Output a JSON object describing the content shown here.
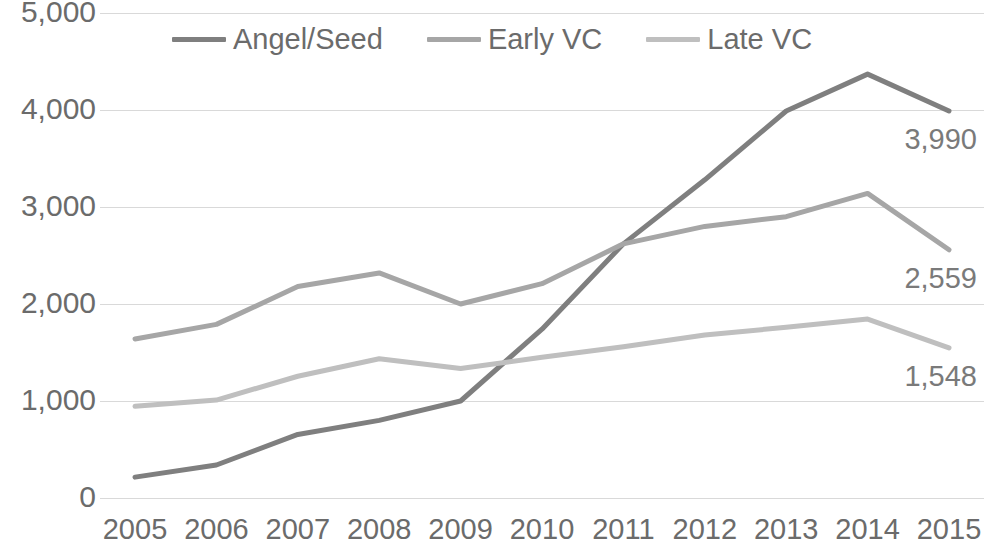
{
  "chart_data": {
    "type": "line",
    "title": "",
    "subtitle": "",
    "xlabel": "",
    "ylabel": "",
    "x": [
      2005,
      2006,
      2007,
      2008,
      2009,
      2010,
      2011,
      2012,
      2013,
      2014,
      2015
    ],
    "categories": [
      "2005",
      "2006",
      "2007",
      "2008",
      "2009",
      "2010",
      "2011",
      "2012",
      "2013",
      "2014",
      "2015"
    ],
    "series": [
      {
        "name": "Angel/Seed",
        "color": "#7f7f7f",
        "values": [
          215,
          340,
          655,
          800,
          1000,
          1740,
          2620,
          3280,
          3990,
          4370,
          3990
        ],
        "end_label": "3,990"
      },
      {
        "name": "Early VC",
        "color": "#a6a6a6",
        "values": [
          1640,
          1790,
          2180,
          2320,
          2000,
          2210,
          2620,
          2800,
          2900,
          3140,
          2559
        ],
        "end_label": "2,559"
      },
      {
        "name": "Late VC",
        "color": "#bfbfbf",
        "values": [
          945,
          1010,
          1255,
          1435,
          1335,
          1450,
          1560,
          1680,
          1760,
          1845,
          1548
        ],
        "end_label": "1,548"
      }
    ],
    "ylim": [
      0,
      5000
    ],
    "ytick_values": [
      0,
      1000,
      2000,
      3000,
      4000,
      5000
    ],
    "ytick_labels": [
      "0",
      "1,000",
      "2,000",
      "3,000",
      "4,000",
      "5,000"
    ],
    "grid": true,
    "grid_color": "#d9d9d9",
    "legend_position": "top-center",
    "axis_text_color": "#6b6b6b",
    "background": "#ffffff"
  },
  "legend": {
    "entries": [
      {
        "label": "Angel/Seed"
      },
      {
        "label": "Early VC"
      },
      {
        "label": "Late VC"
      }
    ]
  },
  "data_labels": {
    "angel_seed_2015": "3,990",
    "early_vc_2015": "2,559",
    "late_vc_2015": "1,548"
  },
  "y_axis": {
    "ticks": [
      "5,000",
      "4,000",
      "3,000",
      "2,000",
      "1,000",
      "0"
    ]
  },
  "x_axis": {
    "ticks": [
      "2005",
      "2006",
      "2007",
      "2008",
      "2009",
      "2010",
      "2011",
      "2012",
      "2013",
      "2014",
      "2015"
    ]
  }
}
